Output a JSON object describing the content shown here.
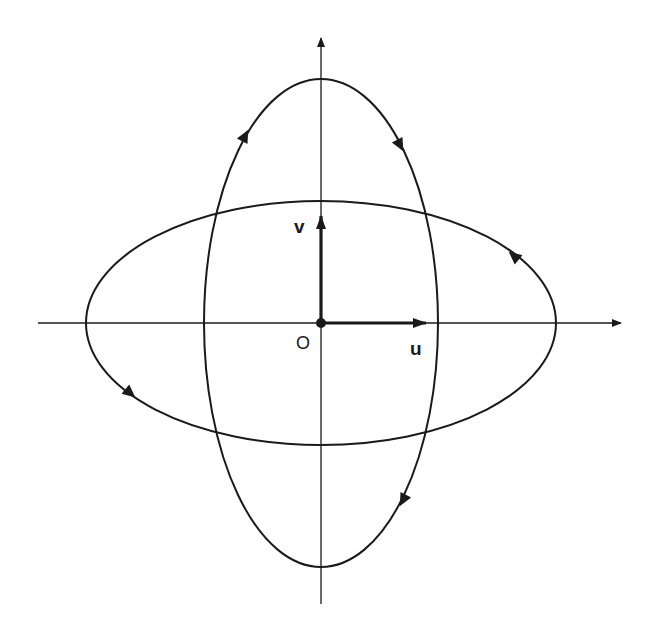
{
  "diagram": {
    "origin_label": "O",
    "u_label": "u",
    "v_label": "v",
    "colors": {
      "stroke": "#1a1a1a",
      "background": "#ffffff"
    },
    "origin": {
      "x": 321,
      "y": 323
    },
    "axes": {
      "horizontal": {
        "x1": 38,
        "x2": 623
      },
      "vertical": {
        "y1": 36,
        "y2": 604
      }
    },
    "ellipses": [
      {
        "name": "vertical-ellipse",
        "rx": 117,
        "ry": 244,
        "direction": "clockwise"
      },
      {
        "name": "horizontal-ellipse",
        "rx": 235,
        "ry": 122,
        "direction": "counterclockwise"
      }
    ]
  }
}
